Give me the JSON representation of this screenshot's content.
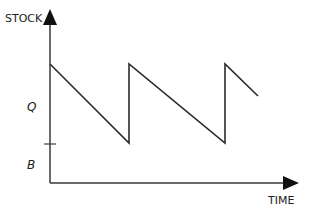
{
  "diagram": {
    "type": "sawtooth inventory stock diagram",
    "y_axis_label": "STOCK",
    "x_axis_label": "TIME",
    "level_labels": {
      "order_quantity": "Q",
      "buffer_stock": "B"
    },
    "colors": {
      "line": "#2b2b2b",
      "background": "#ffffff"
    },
    "sawtooth_points": [
      [
        50,
        64
      ],
      [
        129,
        143
      ],
      [
        129,
        64
      ],
      [
        225,
        143
      ],
      [
        225,
        64
      ],
      [
        258,
        96
      ]
    ]
  }
}
